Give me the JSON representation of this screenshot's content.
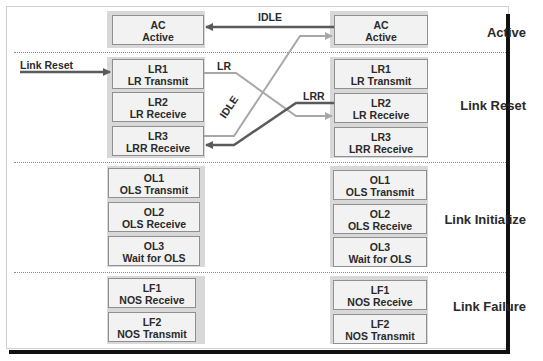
{
  "sections": [
    {
      "label": "Active"
    },
    {
      "label": "Link Reset"
    },
    {
      "label": "Link Initialize"
    },
    {
      "label": "Link Failure"
    }
  ],
  "left_column": {
    "ac": {
      "code": "AC",
      "name": "Active"
    },
    "lr1": {
      "code": "LR1",
      "name": "LR Transmit"
    },
    "lr2": {
      "code": "LR2",
      "name": "LR Receive"
    },
    "lr3": {
      "code": "LR3",
      "name": "LRR Receive"
    },
    "ol1": {
      "code": "OL1",
      "name": "OLS Transmit"
    },
    "ol2": {
      "code": "OL2",
      "name": "OLS Receive"
    },
    "ol3": {
      "code": "OL3",
      "name": "Wait for OLS"
    },
    "lf1": {
      "code": "LF1",
      "name": "NOS Receive"
    },
    "lf2": {
      "code": "LF2",
      "name": "NOS Transmit"
    }
  },
  "right_column": {
    "ac": {
      "code": "AC",
      "name": "Active"
    },
    "lr1": {
      "code": "LR1",
      "name": "LR Transmit"
    },
    "lr2": {
      "code": "LR2",
      "name": "LR Receive"
    },
    "lr3": {
      "code": "LR3",
      "name": "LRR Receive"
    },
    "ol1": {
      "code": "OL1",
      "name": "OLS Transmit"
    },
    "ol2": {
      "code": "OL2",
      "name": "OLS Receive"
    },
    "ol3": {
      "code": "OL3",
      "name": "Wait for OLS"
    },
    "lf1": {
      "code": "LF1",
      "name": "NOS Receive"
    },
    "lf2": {
      "code": "LF2",
      "name": "NOS Transmit"
    }
  },
  "arrows": {
    "link_reset_input": "Link Reset",
    "idle_top": "IDLE",
    "lr": "LR",
    "lrr": "LRR",
    "idle_diagonal": "IDLE"
  },
  "colors": {
    "dark_arrow": "#5a5a5a",
    "light_arrow": "#a8a8a8",
    "box_fill": "#f2f2f2",
    "group_fill": "#d8d8d8"
  }
}
